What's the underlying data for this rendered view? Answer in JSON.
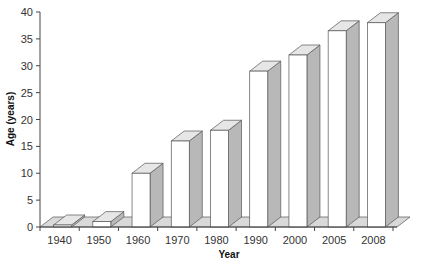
{
  "chart_data": {
    "type": "bar",
    "style": "3d",
    "title": "",
    "xlabel": "Year",
    "ylabel": "Age (years)",
    "categories": [
      "1940",
      "1950",
      "1960",
      "1970",
      "1980",
      "1990",
      "2000",
      "2005",
      "2008"
    ],
    "values": [
      0.2,
      1,
      10,
      16,
      18,
      29,
      32,
      36.5,
      38
    ],
    "ylim": [
      0,
      40
    ],
    "yticks": [
      0,
      5,
      10,
      15,
      20,
      25,
      30,
      35,
      40
    ],
    "grid": false,
    "legend": null,
    "colors": {
      "front": "#ffffff",
      "side": "#b8b8b8",
      "top": "#e6e6e6",
      "floor": "#d9d9d9",
      "stroke": "#555555"
    }
  }
}
